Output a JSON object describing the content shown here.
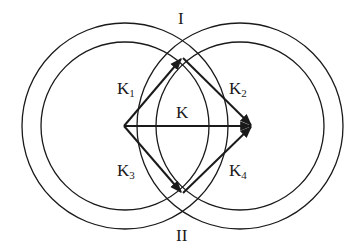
{
  "diagram": {
    "title": "",
    "stroke_color": "#1a1a1a",
    "background": "#ffffff",
    "circles": [
      {
        "id": "left-outer",
        "cx": 125,
        "cy": 126,
        "r": 103
      },
      {
        "id": "left-inner",
        "cx": 125,
        "cy": 126,
        "r": 84
      },
      {
        "id": "right-outer",
        "cx": 240,
        "cy": 126,
        "r": 103
      },
      {
        "id": "right-inner",
        "cx": 240,
        "cy": 126,
        "r": 84
      }
    ],
    "vertices": {
      "start": [
        124,
        126
      ],
      "top": [
        182,
        58
      ],
      "end": [
        252,
        126
      ],
      "bottom": [
        182,
        193
      ]
    },
    "vectors": [
      {
        "id": "K1",
        "from": "start",
        "to": "top"
      },
      {
        "id": "K2",
        "from": "top",
        "to": "end"
      },
      {
        "id": "K",
        "from": "start",
        "to": "end"
      },
      {
        "id": "K3",
        "from": "start",
        "to": "bottom"
      },
      {
        "id": "K4",
        "from": "bottom",
        "to": "end"
      }
    ],
    "labels": {
      "region_top": "I",
      "region_bottom": "II",
      "k": "K",
      "k1_main": "K",
      "k1_sub": "1",
      "k2_main": "K",
      "k2_sub": "2",
      "k3_main": "K",
      "k3_sub": "3",
      "k4_main": "K",
      "k4_sub": "4"
    }
  }
}
